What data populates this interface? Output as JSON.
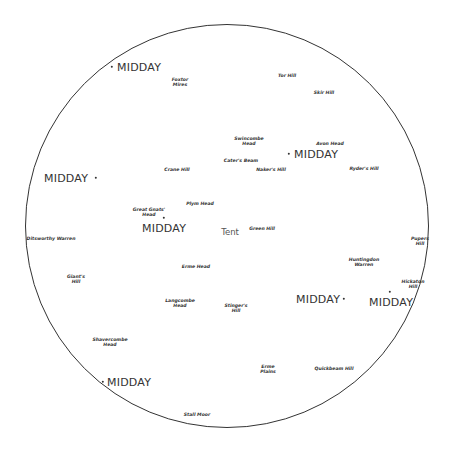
{
  "map": {
    "center_label": "Tent",
    "marker_label": "MIDDAY",
    "places": [
      {
        "id": "fox-tor-mires",
        "label": "Foxtor\nMires"
      },
      {
        "id": "tor-hill",
        "label": "Tor Hill"
      },
      {
        "id": "skir-hill",
        "label": "Skir Hill"
      },
      {
        "id": "swincombe-head",
        "label": "Swincombe\nHead"
      },
      {
        "id": "avon-head",
        "label": "Avon Head"
      },
      {
        "id": "caters-beam",
        "label": "Cater's Beam"
      },
      {
        "id": "nakers-hill",
        "label": "Naker's Hill"
      },
      {
        "id": "ryders-hill",
        "label": "Ryder's Hill"
      },
      {
        "id": "crane-hill",
        "label": "Crane Hill"
      },
      {
        "id": "plym-head",
        "label": "Plym Head"
      },
      {
        "id": "great-gnats-head",
        "label": "Great Gnats'\nHead"
      },
      {
        "id": "green-hill",
        "label": "Green Hill"
      },
      {
        "id": "ditsworthy-warren",
        "label": "Ditsworthy Warren"
      },
      {
        "id": "pupers-hill",
        "label": "Pupers\nHill"
      },
      {
        "id": "huntingdon-warren",
        "label": "Huntingdon\nWarren"
      },
      {
        "id": "hickaton-hill",
        "label": "Hickaton\nHill"
      },
      {
        "id": "giants-hill",
        "label": "Giant's\nHill"
      },
      {
        "id": "erme-head",
        "label": "Erme Head"
      },
      {
        "id": "langcombe-head",
        "label": "Langcombe\nHead"
      },
      {
        "id": "stingers-hill",
        "label": "Stinger's\nHill"
      },
      {
        "id": "shavercombe-head",
        "label": "Shavercombe\nHead"
      },
      {
        "id": "erme-plains",
        "label": "Erme\nPlains"
      },
      {
        "id": "quickbeam-hill",
        "label": "Quickbeam Hill"
      },
      {
        "id": "stall-moor",
        "label": "Stall Moor"
      }
    ],
    "markers": [
      {
        "id": "midday-1",
        "label": "MIDDAY"
      },
      {
        "id": "midday-2",
        "label": "MIDDAY"
      },
      {
        "id": "midday-3",
        "label": "MIDDAY"
      },
      {
        "id": "midday-4",
        "label": "MIDDAY"
      },
      {
        "id": "midday-5",
        "label": "MIDDAY"
      },
      {
        "id": "midday-6",
        "label": "MIDDAY"
      },
      {
        "id": "midday-7",
        "label": "MIDDAY"
      }
    ]
  }
}
